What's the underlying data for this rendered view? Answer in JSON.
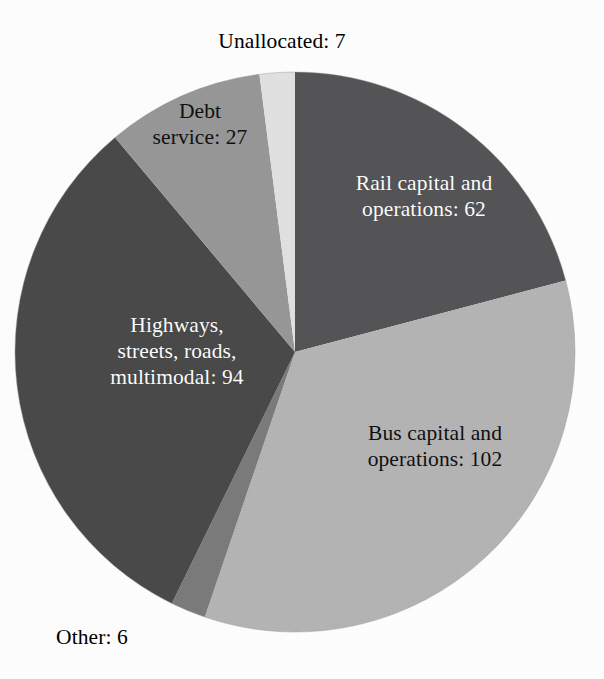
{
  "chart_data": {
    "type": "pie",
    "title": "",
    "subtitle": "",
    "xlabel": "",
    "ylabel": "",
    "legend_position": "none",
    "grid": false,
    "total": 297,
    "units": "",
    "start_angle_deg": 0,
    "direction": "clockwise",
    "categories": [
      "Rail capital and operations",
      "Bus capital and operations",
      "Other",
      "Highways, streets, roads, multimodal",
      "Debt service",
      "Unallocated"
    ],
    "values": [
      62,
      102,
      6,
      94,
      27,
      7
    ],
    "slices": [
      {
        "name": "Rail capital and operations",
        "value": 62,
        "label": "Rail capital and\noperations: 62",
        "color": "#555558",
        "label_color": "#ffffff",
        "label_placement": "inside",
        "start_angle_deg": 0.0,
        "end_angle_deg": 75.2
      },
      {
        "name": "Bus capital and operations",
        "value": 102,
        "label": "Bus capital and\noperations: 102",
        "color": "#b5b5b5",
        "label_color": "#111111",
        "label_placement": "inside",
        "start_angle_deg": 75.2,
        "end_angle_deg": 198.8
      },
      {
        "name": "Other",
        "value": 6,
        "label": "Other: 6",
        "color": "#7c7c7c",
        "label_color": "#000000",
        "label_placement": "outside",
        "start_angle_deg": 198.8,
        "end_angle_deg": 206.1
      },
      {
        "name": "Highways, streets, roads, multimodal",
        "value": 94,
        "label": "Highways,\nstreets, roads,\nmultimodal: 94",
        "color": "#4a4a4a",
        "label_color": "#ffffff",
        "label_placement": "inside",
        "start_angle_deg": 206.1,
        "end_angle_deg": 320.0
      },
      {
        "name": "Debt service",
        "value": 27,
        "label": "Debt\nservice: 27",
        "color": "#989898",
        "label_color": "#111111",
        "label_placement": "inside",
        "start_angle_deg": 320.0,
        "end_angle_deg": 352.7
      },
      {
        "name": "Unallocated",
        "value": 7,
        "label": "Unallocated: 7",
        "color": "#e2e2e2",
        "label_color": "#000000",
        "label_placement": "outside",
        "start_angle_deg": 352.7,
        "end_angle_deg": 360.0
      }
    ]
  },
  "labels": {
    "rail": "Rail capital and\noperations: 62",
    "bus": "Bus capital and\noperations: 102",
    "other": "Other: 6",
    "highways": "Highways,\nstreets, roads,\nmultimodal: 94",
    "debt": "Debt\nservice: 27",
    "unallocated": "Unallocated: 7"
  },
  "colors": {
    "background": "#ffffff",
    "rail": "#555558",
    "bus": "#b5b5b5",
    "other": "#7c7c7c",
    "highways": "#4a4a4a",
    "debt": "#989898",
    "unallocated": "#e2e2e2",
    "outline": "#9a9a9a"
  },
  "geometry": {
    "center_x": 295,
    "center_y": 352,
    "radius": 280
  }
}
